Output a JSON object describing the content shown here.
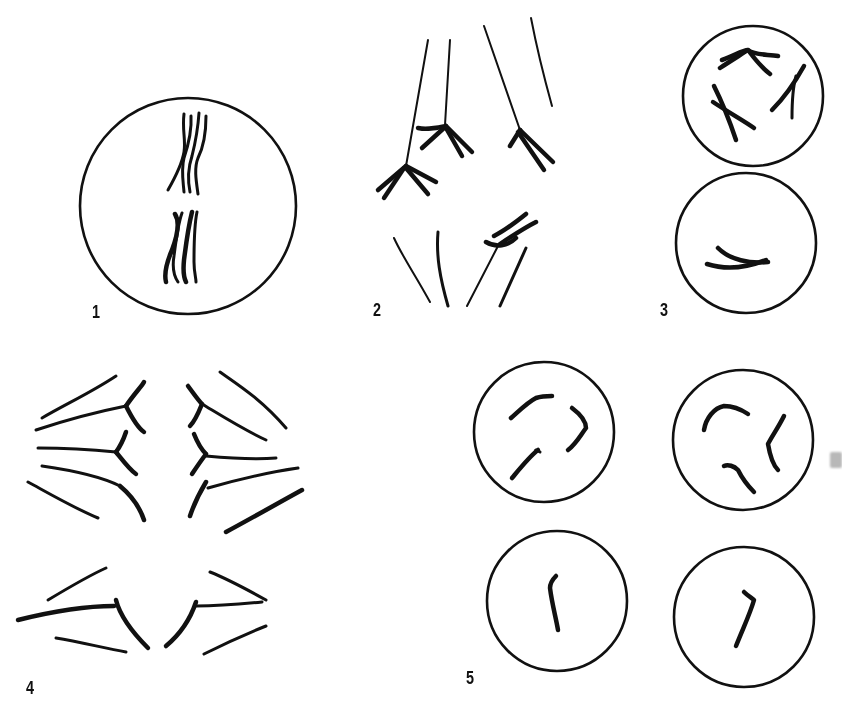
{
  "figure": {
    "panels": [
      {
        "id": "panel-1",
        "label": "1",
        "description": "single cell with two groups of chromosomes aligned"
      },
      {
        "id": "panel-2",
        "label": "2",
        "description": "chromosomes with spindle fibers and branched arms"
      },
      {
        "id": "panel-3",
        "label": "3",
        "description": "two stacked cells with chromosomes"
      },
      {
        "id": "panel-4",
        "label": "4",
        "description": "separating chromosomes pulled toward poles"
      },
      {
        "id": "panel-5",
        "label": "5",
        "description": "four daughter cells with chromosomes"
      }
    ],
    "colors": {
      "background": "#ffffff",
      "ink": "#111111",
      "smudge": "#b8b8b8"
    }
  }
}
